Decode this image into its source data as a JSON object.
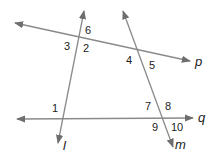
{
  "diagram": {
    "colors": {
      "line": "#8a8a8a",
      "text": "#222222",
      "background": "#ffffff"
    },
    "lines": [
      {
        "name": "p",
        "label": "p",
        "x1": 15,
        "y1": 23,
        "x2": 190,
        "y2": 61,
        "arrows": "both"
      },
      {
        "name": "q",
        "label": "q",
        "x1": 17,
        "y1": 119,
        "x2": 193,
        "y2": 118,
        "arrows": "both"
      },
      {
        "name": "l",
        "label": "l",
        "x1": 84,
        "y1": 11,
        "x2": 58,
        "y2": 143,
        "arrows": "both"
      },
      {
        "name": "m",
        "label": "m",
        "x1": 123,
        "y1": 11,
        "x2": 173,
        "y2": 147,
        "arrows": "both"
      }
    ],
    "line_labels": {
      "p": "p",
      "q": "q",
      "l": "l",
      "m": "m"
    },
    "angles": [
      {
        "id": "1",
        "label": "1",
        "x": 52,
        "y": 112
      },
      {
        "id": "2",
        "label": "2",
        "x": 83,
        "y": 52
      },
      {
        "id": "3",
        "label": "3",
        "x": 64,
        "y": 50
      },
      {
        "id": "4",
        "label": "4",
        "x": 126,
        "y": 64
      },
      {
        "id": "5",
        "label": "5",
        "x": 149,
        "y": 69
      },
      {
        "id": "6",
        "label": "6",
        "x": 85,
        "y": 34
      },
      {
        "id": "7",
        "label": "7",
        "x": 145,
        "y": 110
      },
      {
        "id": "8",
        "label": "8",
        "x": 165,
        "y": 110
      },
      {
        "id": "9",
        "label": "9",
        "x": 152,
        "y": 131
      },
      {
        "id": "10",
        "label": "10",
        "x": 171,
        "y": 131
      }
    ]
  }
}
